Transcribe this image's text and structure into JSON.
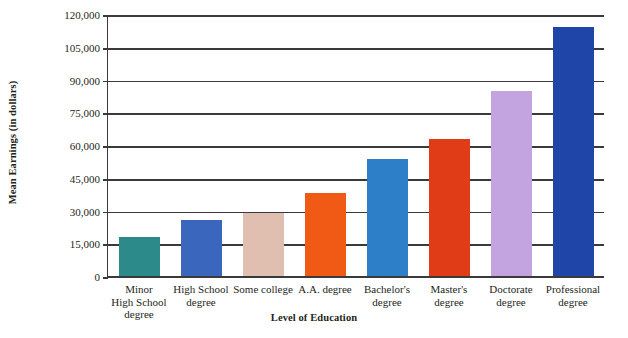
{
  "chart_data": {
    "type": "bar",
    "title": "",
    "xlabel": "Level of Education",
    "ylabel": "Mean Earnings (in dollars)",
    "categories": [
      "Minor\nHigh School\ndegree",
      "High School\ndegree",
      "Some college",
      "A.A. degree",
      "Bachelor's\ndegree",
      "Master's\ndegree",
      "Doctorate\ndegree",
      "Professional\ndegree"
    ],
    "category_lines": [
      [
        "Minor",
        "High School",
        "degree"
      ],
      [
        "High School",
        "degree"
      ],
      [
        "Some college"
      ],
      [
        "A.A. degree"
      ],
      [
        "Bachelor's",
        "degree"
      ],
      [
        "Master's",
        "degree"
      ],
      [
        "Doctorate",
        "degree"
      ],
      [
        "Professional",
        "degree"
      ]
    ],
    "values": [
      19000,
      26500,
      30000,
      39000,
      54500,
      63500,
      85500,
      115000
    ],
    "colors": [
      "#2d8a8a",
      "#3a66bd",
      "#e0bfb0",
      "#f05a14",
      "#2d80c8",
      "#e03c18",
      "#c3a4e0",
      "#1f45a8"
    ],
    "ylim": [
      0,
      120000
    ],
    "yticks": [
      0,
      15000,
      30000,
      45000,
      60000,
      75000,
      90000,
      105000,
      120000
    ],
    "ytick_labels": [
      "0",
      "15,000",
      "30,000",
      "45,000",
      "60,000",
      "75,000",
      "90,000",
      "105,000",
      "120,000"
    ],
    "grid": true,
    "legend": "none"
  }
}
